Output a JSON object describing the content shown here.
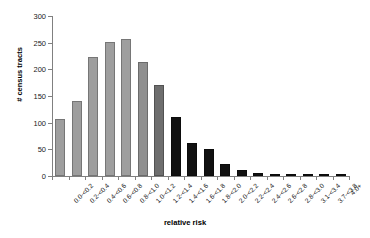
{
  "chart_data": {
    "type": "bar",
    "title": "",
    "xlabel": "relative risk",
    "ylabel": "# census tracts",
    "ylim": [
      0,
      300
    ],
    "yticks": [
      0,
      50,
      100,
      150,
      200,
      250,
      300
    ],
    "ytick_labels": [
      "0",
      "50",
      "100",
      "150",
      "200",
      "250",
      "300"
    ],
    "grid": false,
    "legend": "none",
    "categories": [
      "0.0-<0.2",
      "0.2-<0.4",
      "0.4-<0.6",
      "0.6-<0.8",
      "0.8-<1.0",
      "1.0-<1.2",
      "1.2-<1.4",
      "1.4-<1.6",
      "1.6-<1.8",
      "1.8-<2.0",
      "2.0-<2.2",
      "2.2-<2.4",
      "2.4-<2.6",
      "2.6-<2.8",
      "2.8-<3.0",
      "3.1-<3.4",
      "3.7-<3.8",
      "4.0+"
    ],
    "values": [
      107,
      141,
      223,
      252,
      257,
      213,
      171,
      110,
      62,
      51,
      23,
      12,
      6,
      2,
      2,
      1,
      1,
      1
    ],
    "bar_colors": [
      "#9e9e9e",
      "#9e9e9e",
      "#9e9e9e",
      "#9e9e9e",
      "#9e9e9e",
      "#8f8f8f",
      "#6e6e6e",
      "#111111",
      "#111111",
      "#111111",
      "#111111",
      "#111111",
      "#111111",
      "#111111",
      "#111111",
      "#111111",
      "#111111",
      "#111111"
    ]
  }
}
